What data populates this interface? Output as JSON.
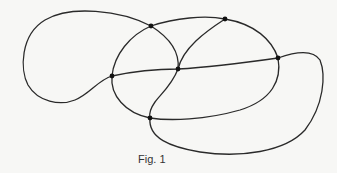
{
  "figure": {
    "caption": "Fig. 1",
    "stroke_color": "#2a2a2a",
    "node_color": "#111111",
    "nodes": [
      {
        "id": "n1",
        "x": 151,
        "y": 26
      },
      {
        "id": "n2",
        "x": 225,
        "y": 19
      },
      {
        "id": "n3",
        "x": 112,
        "y": 76
      },
      {
        "id": "n4",
        "x": 178,
        "y": 69
      },
      {
        "id": "n5",
        "x": 278,
        "y": 58
      },
      {
        "id": "n6",
        "x": 150,
        "y": 118
      }
    ]
  }
}
